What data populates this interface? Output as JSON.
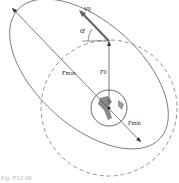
{
  "diagram": {
    "labels": {
      "v0": {
        "main": "v",
        "sub": "0"
      },
      "alpha": "α",
      "r0": {
        "main": "r",
        "sub": "0"
      },
      "rmax": {
        "main": "r",
        "sub": "max"
      },
      "rmin": {
        "main": "r",
        "sub": "min"
      }
    },
    "caption": "Fig. P12.99",
    "colors": {
      "line": "#555555",
      "earth": "#888888",
      "arrow": "#666666"
    }
  }
}
